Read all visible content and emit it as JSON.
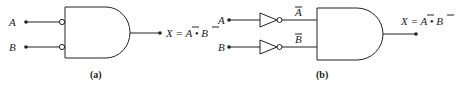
{
  "diagram": {
    "panel_a": {
      "caption": "(a)",
      "inputs": [
        {
          "label": "A",
          "inverted_bubble": true
        },
        {
          "label": "B",
          "inverted_bubble": true
        }
      ],
      "gate": "AND",
      "output_expr": {
        "prefix": "X = ",
        "a": "A",
        "dot": " • ",
        "b": "B"
      }
    },
    "panel_b": {
      "caption": "(b)",
      "inputs": [
        {
          "label": "A",
          "inverter_label": "A"
        },
        {
          "label": "B",
          "inverter_label": "B"
        }
      ],
      "gate": "AND",
      "output_expr": {
        "prefix": "X = ",
        "a": "A",
        "dot": " • ",
        "b": "B"
      }
    },
    "colors": {
      "stroke": "#222222",
      "background": "#ffffff"
    }
  }
}
